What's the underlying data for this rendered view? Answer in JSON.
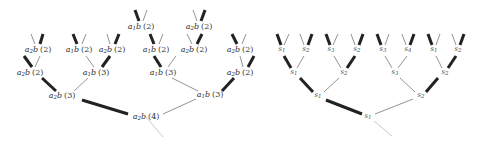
{
  "left_tree": {
    "nodes": [
      {
        "id": "L0",
        "label": "a",
        "sub": "2",
        "suffix": "b",
        "count": "(4)",
        "x": 146,
        "y": 117
      },
      {
        "id": "L1a",
        "label": "a",
        "sub": "2",
        "suffix": "b",
        "count": "(3)",
        "x": 62,
        "y": 96
      },
      {
        "id": "L1b",
        "label": "a",
        "sub": "1",
        "suffix": "b",
        "count": "(3)",
        "x": 210,
        "y": 95
      },
      {
        "id": "L2a",
        "label": "a",
        "sub": "2",
        "suffix": "b",
        "count": "(2)",
        "x": 30,
        "y": 73
      },
      {
        "id": "L2b",
        "label": "a",
        "sub": "1",
        "suffix": "b",
        "count": "(3)",
        "x": 96,
        "y": 73
      },
      {
        "id": "L2c",
        "label": "a",
        "sub": "1",
        "suffix": "b",
        "count": "(3)",
        "x": 163,
        "y": 73
      },
      {
        "id": "L2d",
        "label": "a",
        "sub": "2",
        "suffix": "b",
        "count": "(2)",
        "x": 240,
        "y": 73
      },
      {
        "id": "L3a",
        "label": "a",
        "sub": "2",
        "suffix": "b",
        "count": "(2)",
        "x": 38,
        "y": 50
      },
      {
        "id": "L3b",
        "label": "a",
        "sub": "1",
        "suffix": "b",
        "count": "(2)",
        "x": 79,
        "y": 50
      },
      {
        "id": "L3c",
        "label": "a",
        "sub": "2",
        "suffix": "b",
        "count": "(2)",
        "x": 112,
        "y": 50
      },
      {
        "id": "L3d",
        "label": "a",
        "sub": "1",
        "suffix": "b",
        "count": "(2)",
        "x": 156,
        "y": 50
      },
      {
        "id": "L3e",
        "label": "a",
        "sub": "2",
        "suffix": "b",
        "count": "(2)",
        "x": 194,
        "y": 50
      },
      {
        "id": "L3f",
        "label": "a",
        "sub": "2",
        "suffix": "b",
        "count": "(2)",
        "x": 240,
        "y": 50
      },
      {
        "id": "L4a",
        "label": "a",
        "sub": "1",
        "suffix": "b",
        "count": "(2)",
        "x": 141,
        "y": 27
      },
      {
        "id": "L4b",
        "label": "a",
        "sub": "2",
        "suffix": "b",
        "count": "(2)",
        "x": 199,
        "y": 27
      }
    ],
    "edges": [
      {
        "x1": 146,
        "y1": 117,
        "x2": 163,
        "y2": 137,
        "w": 0.8,
        "color": "#bbbbbb"
      },
      {
        "x1": 82,
        "y1": 100,
        "x2": 128,
        "y2": 114,
        "w": 3,
        "color": "#222222"
      },
      {
        "x1": 196,
        "y1": 99,
        "x2": 163,
        "y2": 114,
        "w": 0.8,
        "color": "#777777"
      },
      {
        "x1": 42,
        "y1": 78,
        "x2": 56,
        "y2": 91,
        "w": 3,
        "color": "#222222"
      },
      {
        "x1": 88,
        "y1": 78,
        "x2": 74,
        "y2": 91,
        "w": 0.8,
        "color": "#777777"
      },
      {
        "x1": 172,
        "y1": 78,
        "x2": 198,
        "y2": 91,
        "w": 0.8,
        "color": "#777777"
      },
      {
        "x1": 234,
        "y1": 78,
        "x2": 222,
        "y2": 91,
        "w": 3,
        "color": "#222222"
      },
      {
        "x1": 24,
        "y1": 56,
        "x2": 32,
        "y2": 67,
        "w": 3,
        "color": "#222222"
      },
      {
        "x1": 40,
        "y1": 56,
        "x2": 35,
        "y2": 67,
        "w": 0.8,
        "color": "#777777"
      },
      {
        "x1": 86,
        "y1": 56,
        "x2": 94,
        "y2": 67,
        "w": 0.8,
        "color": "#777777"
      },
      {
        "x1": 110,
        "y1": 56,
        "x2": 102,
        "y2": 67,
        "w": 3,
        "color": "#222222"
      },
      {
        "x1": 154,
        "y1": 56,
        "x2": 161,
        "y2": 67,
        "w": 3,
        "color": "#222222"
      },
      {
        "x1": 176,
        "y1": 56,
        "x2": 168,
        "y2": 67,
        "w": 0.8,
        "color": "#777777"
      },
      {
        "x1": 240,
        "y1": 56,
        "x2": 243,
        "y2": 67,
        "w": 0.8,
        "color": "#777777"
      },
      {
        "x1": 254,
        "y1": 56,
        "x2": 248,
        "y2": 67,
        "w": 3,
        "color": "#222222"
      },
      {
        "x1": 31,
        "y1": 34,
        "x2": 35,
        "y2": 44,
        "w": 0.8,
        "color": "#777777"
      },
      {
        "x1": 43,
        "y1": 34,
        "x2": 40,
        "y2": 44,
        "w": 3,
        "color": "#222222"
      },
      {
        "x1": 73,
        "y1": 34,
        "x2": 77,
        "y2": 44,
        "w": 3,
        "color": "#222222"
      },
      {
        "x1": 86,
        "y1": 34,
        "x2": 82,
        "y2": 44,
        "w": 0.8,
        "color": "#777777"
      },
      {
        "x1": 107,
        "y1": 34,
        "x2": 110,
        "y2": 44,
        "w": 0.8,
        "color": "#777777"
      },
      {
        "x1": 119,
        "y1": 34,
        "x2": 115,
        "y2": 44,
        "w": 3,
        "color": "#222222"
      },
      {
        "x1": 150,
        "y1": 34,
        "x2": 154,
        "y2": 44,
        "w": 3,
        "color": "#222222"
      },
      {
        "x1": 163,
        "y1": 34,
        "x2": 159,
        "y2": 44,
        "w": 0.8,
        "color": "#777777"
      },
      {
        "x1": 187,
        "y1": 34,
        "x2": 192,
        "y2": 44,
        "w": 0.8,
        "color": "#777777"
      },
      {
        "x1": 202,
        "y1": 34,
        "x2": 197,
        "y2": 44,
        "w": 3,
        "color": "#222222"
      },
      {
        "x1": 232,
        "y1": 34,
        "x2": 237,
        "y2": 44,
        "w": 3,
        "color": "#222222"
      },
      {
        "x1": 246,
        "y1": 34,
        "x2": 242,
        "y2": 44,
        "w": 0.8,
        "color": "#777777"
      },
      {
        "x1": 135,
        "y1": 10,
        "x2": 139,
        "y2": 21,
        "w": 3,
        "color": "#222222"
      },
      {
        "x1": 147,
        "y1": 10,
        "x2": 143,
        "y2": 21,
        "w": 0.8,
        "color": "#777777"
      },
      {
        "x1": 193,
        "y1": 10,
        "x2": 197,
        "y2": 21,
        "w": 0.8,
        "color": "#777777"
      },
      {
        "x1": 205,
        "y1": 10,
        "x2": 201,
        "y2": 21,
        "w": 3,
        "color": "#222222"
      }
    ]
  },
  "right_tree": {
    "nodes": [
      {
        "id": "R0",
        "label": "s",
        "sub": "1",
        "x": 368,
        "y": 117
      },
      {
        "id": "R1a",
        "label": "s",
        "sub": "1",
        "x": 318,
        "y": 96
      },
      {
        "id": "R1b",
        "label": "s",
        "sub": "2",
        "x": 421,
        "y": 96
      },
      {
        "id": "R2a",
        "label": "s",
        "sub": "1",
        "x": 294,
        "y": 73
      },
      {
        "id": "R2b",
        "label": "s",
        "sub": "2",
        "x": 344,
        "y": 73
      },
      {
        "id": "R2c",
        "label": "s",
        "sub": "3",
        "x": 395,
        "y": 73
      },
      {
        "id": "R2d",
        "label": "s",
        "sub": "2",
        "x": 445,
        "y": 73
      },
      {
        "id": "R3a",
        "label": "s",
        "sub": "1",
        "x": 282,
        "y": 50
      },
      {
        "id": "R3b",
        "label": "s",
        "sub": "2",
        "x": 306,
        "y": 50
      },
      {
        "id": "R3c",
        "label": "s",
        "sub": "3",
        "x": 331,
        "y": 50
      },
      {
        "id": "R3d",
        "label": "s",
        "sub": "2",
        "x": 357,
        "y": 50
      },
      {
        "id": "R3e",
        "label": "s",
        "sub": "3",
        "x": 383,
        "y": 50
      },
      {
        "id": "R3f",
        "label": "s",
        "sub": "4",
        "x": 408,
        "y": 50
      },
      {
        "id": "R3g",
        "label": "s",
        "sub": "1",
        "x": 434,
        "y": 50
      },
      {
        "id": "R3h",
        "label": "s",
        "sub": "2",
        "x": 458,
        "y": 50
      }
    ],
    "edges": [
      {
        "x1": 374,
        "y1": 121,
        "x2": 392,
        "y2": 136,
        "w": 0.8,
        "color": "#bbbbbb"
      },
      {
        "x1": 326,
        "y1": 100,
        "x2": 362,
        "y2": 114,
        "w": 3,
        "color": "#222222"
      },
      {
        "x1": 413,
        "y1": 99,
        "x2": 375,
        "y2": 114,
        "w": 0.8,
        "color": "#777777"
      },
      {
        "x1": 300,
        "y1": 78,
        "x2": 313,
        "y2": 92,
        "w": 3,
        "color": "#222222"
      },
      {
        "x1": 339,
        "y1": 78,
        "x2": 324,
        "y2": 92,
        "w": 0.8,
        "color": "#777777"
      },
      {
        "x1": 400,
        "y1": 78,
        "x2": 415,
        "y2": 92,
        "w": 0.8,
        "color": "#777777"
      },
      {
        "x1": 438,
        "y1": 78,
        "x2": 426,
        "y2": 92,
        "w": 3,
        "color": "#222222"
      },
      {
        "x1": 284,
        "y1": 56,
        "x2": 291,
        "y2": 68,
        "w": 3,
        "color": "#222222"
      },
      {
        "x1": 304,
        "y1": 56,
        "x2": 297,
        "y2": 68,
        "w": 0.8,
        "color": "#777777"
      },
      {
        "x1": 334,
        "y1": 56,
        "x2": 341,
        "y2": 68,
        "w": 0.8,
        "color": "#777777"
      },
      {
        "x1": 355,
        "y1": 56,
        "x2": 347,
        "y2": 68,
        "w": 3,
        "color": "#222222"
      },
      {
        "x1": 385,
        "y1": 56,
        "x2": 392,
        "y2": 68,
        "w": 0.8,
        "color": "#777777"
      },
      {
        "x1": 407,
        "y1": 56,
        "x2": 398,
        "y2": 68,
        "w": 0.8,
        "color": "#777777"
      },
      {
        "x1": 436,
        "y1": 56,
        "x2": 442,
        "y2": 68,
        "w": 0.8,
        "color": "#777777"
      },
      {
        "x1": 456,
        "y1": 56,
        "x2": 448,
        "y2": 68,
        "w": 3,
        "color": "#222222"
      },
      {
        "x1": 277,
        "y1": 34,
        "x2": 281,
        "y2": 45,
        "w": 3,
        "color": "#222222"
      },
      {
        "x1": 289,
        "y1": 34,
        "x2": 284,
        "y2": 45,
        "w": 0.8,
        "color": "#777777"
      },
      {
        "x1": 300,
        "y1": 34,
        "x2": 304,
        "y2": 45,
        "w": 0.8,
        "color": "#777777"
      },
      {
        "x1": 312,
        "y1": 34,
        "x2": 308,
        "y2": 45,
        "w": 3,
        "color": "#222222"
      },
      {
        "x1": 326,
        "y1": 34,
        "x2": 330,
        "y2": 45,
        "w": 3,
        "color": "#222222"
      },
      {
        "x1": 338,
        "y1": 34,
        "x2": 333,
        "y2": 45,
        "w": 0.8,
        "color": "#777777"
      },
      {
        "x1": 351,
        "y1": 34,
        "x2": 355,
        "y2": 45,
        "w": 0.8,
        "color": "#777777"
      },
      {
        "x1": 363,
        "y1": 34,
        "x2": 359,
        "y2": 45,
        "w": 3,
        "color": "#222222"
      },
      {
        "x1": 377,
        "y1": 34,
        "x2": 381,
        "y2": 45,
        "w": 3,
        "color": "#222222"
      },
      {
        "x1": 389,
        "y1": 34,
        "x2": 385,
        "y2": 45,
        "w": 0.8,
        "color": "#777777"
      },
      {
        "x1": 402,
        "y1": 34,
        "x2": 406,
        "y2": 45,
        "w": 0.8,
        "color": "#777777"
      },
      {
        "x1": 414,
        "y1": 34,
        "x2": 410,
        "y2": 45,
        "w": 3,
        "color": "#222222"
      },
      {
        "x1": 428,
        "y1": 34,
        "x2": 432,
        "y2": 45,
        "w": 3,
        "color": "#222222"
      },
      {
        "x1": 440,
        "y1": 34,
        "x2": 436,
        "y2": 45,
        "w": 0.8,
        "color": "#777777"
      },
      {
        "x1": 452,
        "y1": 34,
        "x2": 456,
        "y2": 45,
        "w": 0.8,
        "color": "#777777"
      },
      {
        "x1": 464,
        "y1": 34,
        "x2": 460,
        "y2": 45,
        "w": 3,
        "color": "#222222"
      }
    ]
  }
}
